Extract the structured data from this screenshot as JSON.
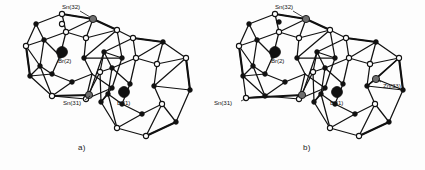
{
  "figure": {
    "background_color": "#fdfdfd",
    "panels": [
      {
        "id": "a",
        "caption": "a)",
        "atom_labels": [
          {
            "name": "Sn(32)",
            "text": "Sn(32)",
            "x": 62,
            "y": 4,
            "node_x": 93,
            "node_y": 19,
            "node_type": "gray"
          },
          {
            "name": "Br(2)",
            "text": "Br(2)",
            "x": 60,
            "y": 59,
            "node_x": 62,
            "node_y": 52,
            "node_type": "black-large"
          },
          {
            "name": "Sn(31)",
            "text": "Sn(31)",
            "x": 64,
            "y": 100,
            "node_x": 89,
            "node_y": 95,
            "node_type": "gray"
          },
          {
            "name": "Br(1)",
            "text": "Br(1)",
            "x": 118,
            "y": 101,
            "node_x": 124,
            "node_y": 92,
            "node_type": "black-large"
          }
        ]
      },
      {
        "id": "b",
        "caption": "b)",
        "atom_labels": [
          {
            "name": "Sn(32)",
            "text": "Sn(32)",
            "x": 62,
            "y": 4,
            "node_x": 93,
            "node_y": 19,
            "node_type": "gray"
          },
          {
            "name": "Br(2)",
            "text": "Br(2)",
            "x": 60,
            "y": 59,
            "node_x": 62,
            "node_y": 52,
            "node_type": "black-large"
          },
          {
            "name": "Sn(31)",
            "text": "Sn(31)",
            "x": 1,
            "y": 101,
            "node_x": 33,
            "node_y": 98,
            "node_type": "gray"
          },
          {
            "name": "Br(1)",
            "text": "Br(1)",
            "x": 118,
            "y": 101,
            "node_x": 124,
            "node_y": 92,
            "node_type": "black-large"
          },
          {
            "name": "Zn(33)",
            "text": "Zn(33)",
            "x": 170,
            "y": 84,
            "node_x": 163,
            "node_y": 79,
            "node_type": "gray"
          }
        ]
      }
    ],
    "colors": {
      "bond_line": "#111111",
      "node_black": "#111111",
      "node_gray": "#6e6e6e",
      "node_white": "#ffffff",
      "label_text": "#151515",
      "caption_text": "#1a1a1a"
    },
    "legend_notes": {
      "black_sphere": "encapsulated Br atom",
      "gray_sphere": "heteroatom substitution site (Sn / Zn)",
      "open_sphere": "cage vertex (front)",
      "filled_small_sphere": "cage vertex (rear)"
    }
  }
}
